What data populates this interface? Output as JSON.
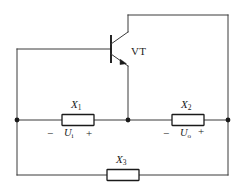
{
  "figure": {
    "kind": "circuit-schematic",
    "background_color": "#ffffff",
    "line_color": "#3a3a3a",
    "text_color": "#1a1a1a",
    "width": 244,
    "height": 189
  },
  "transistor": {
    "label": "VT",
    "type": "npn-bipolar-transistor"
  },
  "components": {
    "x1": {
      "name": "X1",
      "symbol": "X",
      "subscript": "1"
    },
    "x2": {
      "name": "X2",
      "symbol": "X",
      "subscript": "2"
    },
    "x3": {
      "name": "X3",
      "symbol": "X",
      "subscript": "3"
    }
  },
  "voltages": {
    "input": {
      "symbol": "U",
      "subscript": "i",
      "minus": "−",
      "plus": "+"
    },
    "output": {
      "symbol": "U",
      "subscript": "o",
      "minus": "−",
      "plus": "+"
    }
  },
  "nodes": [
    {
      "name": "left-node",
      "x": 17,
      "y": 120
    },
    {
      "name": "center-node",
      "x": 128,
      "y": 120
    },
    {
      "name": "right-node",
      "x": 228,
      "y": 120
    }
  ]
}
